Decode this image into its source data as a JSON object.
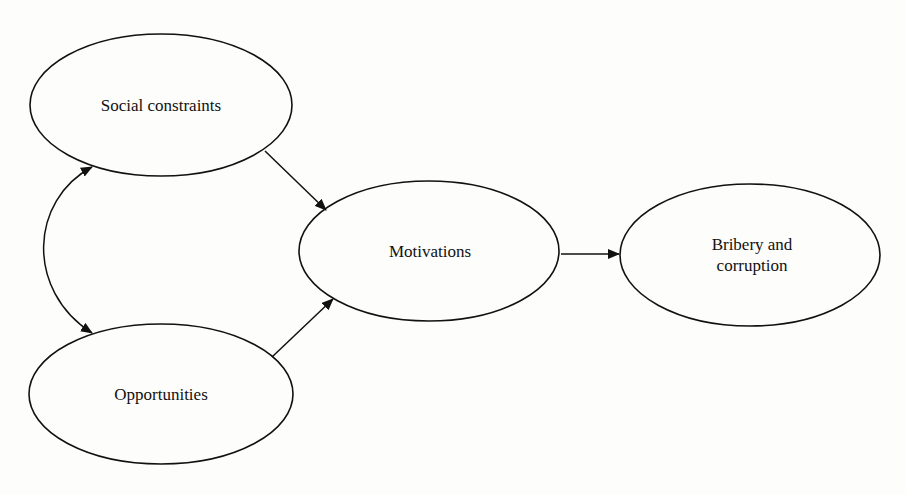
{
  "diagram": {
    "type": "path-diagram",
    "colors": {
      "stroke": "#111111",
      "background": "#fdfdfb",
      "text": "#111111"
    },
    "nodes": [
      {
        "id": "social",
        "label": "Social constraints",
        "cx": 161,
        "cy": 105,
        "rx": 131,
        "ry": 71
      },
      {
        "id": "opportunities",
        "label": "Opportunities",
        "cx": 161,
        "cy": 394,
        "rx": 132,
        "ry": 70
      },
      {
        "id": "motivations",
        "label": "Motivations",
        "cx": 429,
        "cy": 251,
        "rx": 130,
        "ry": 70
      },
      {
        "id": "bribery",
        "label": "Bribery and\ncorruption",
        "cx": 750,
        "cy": 255,
        "rx": 130,
        "ry": 71
      }
    ],
    "edges": [
      {
        "from": "social",
        "to": "opportunities",
        "style": "double-headed-curve"
      },
      {
        "from": "social",
        "to": "motivations",
        "style": "arrow"
      },
      {
        "from": "opportunities",
        "to": "motivations",
        "style": "arrow"
      },
      {
        "from": "motivations",
        "to": "bribery",
        "style": "arrow"
      }
    ]
  }
}
